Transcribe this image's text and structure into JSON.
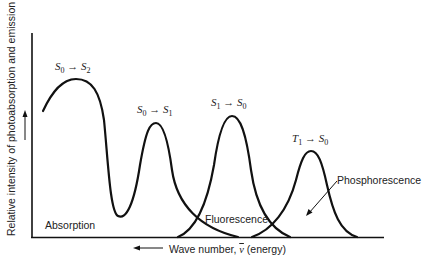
{
  "figure": {
    "y_axis_label": "Relative intensity of photoabsorption and emission",
    "x_axis_label_prefix": "Wave number, ",
    "x_axis_symbol": "ν",
    "x_axis_label_suffix": " (energy)",
    "regions": {
      "absorption": "Absorption",
      "fluorescence": "Fluorescence",
      "phosphorescence": "Phosphorescence"
    },
    "transitions": [
      {
        "from": "S",
        "from_sub": "0",
        "arrow": " → ",
        "to": "S",
        "to_sub": "2"
      },
      {
        "from": "S",
        "from_sub": "0",
        "arrow": " → ",
        "to": "S",
        "to_sub": "1"
      },
      {
        "from": "S",
        "from_sub": "1",
        "arrow": " → ",
        "to": "S",
        "to_sub": "0"
      },
      {
        "from": "T",
        "from_sub": "1",
        "arrow": " → ",
        "to": "S",
        "to_sub": "0"
      }
    ],
    "colors": {
      "line": "#111111",
      "text": "#222222",
      "background": "#ffffff"
    }
  }
}
